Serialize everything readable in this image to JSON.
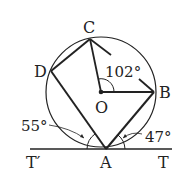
{
  "diagram": {
    "type": "circle-geometry",
    "points": {
      "C": "C",
      "D": "D",
      "O": "O",
      "B": "B",
      "A": "A",
      "T_prime": "T′",
      "T": "T"
    },
    "angles": {
      "COB": "102°",
      "left_tangent": "55°",
      "right_tangent": "47°"
    },
    "colors": {
      "stroke": "#222222",
      "background": "#ffffff"
    }
  }
}
